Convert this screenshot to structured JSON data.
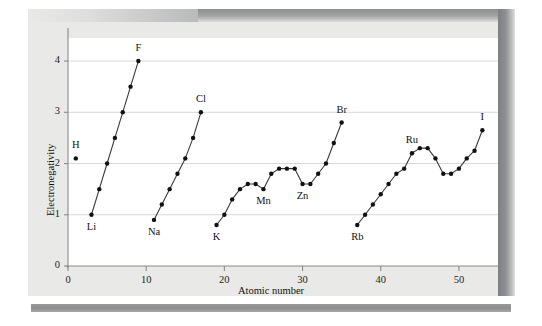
{
  "figure": {
    "background_color": "#e9e9e7",
    "plot_background_color": "#ffffff",
    "line_color": "#3a3a3a",
    "marker_color": "#111111",
    "grid_color": "#d8d8d8",
    "axis_color": "#8a8a8a"
  },
  "chart_data": {
    "type": "line",
    "title": "",
    "xlabel": "Atomic number",
    "ylabel": "Electronegativity",
    "xlim": [
      0,
      55
    ],
    "ylim": [
      0,
      4.45
    ],
    "xticks": [
      0,
      10,
      20,
      30,
      40,
      50
    ],
    "xtick_labels": [
      "0",
      "10",
      "20",
      "30",
      "40",
      "50"
    ],
    "yticks": [
      0,
      1,
      2,
      3,
      4
    ],
    "ytick_labels": [
      "0",
      "1",
      "2",
      "3",
      "4"
    ],
    "grid": "horizontal",
    "legend": "none",
    "series": [
      {
        "name": "hydrogen",
        "style": "marker-only",
        "points": [
          {
            "x": 1,
            "y": 2.1,
            "element": "H"
          }
        ]
      },
      {
        "name": "period-2",
        "style": "line-marker",
        "points": [
          {
            "x": 3,
            "y": 1.0,
            "element": "Li"
          },
          {
            "x": 4,
            "y": 1.5,
            "element": "Be"
          },
          {
            "x": 5,
            "y": 2.0,
            "element": "B"
          },
          {
            "x": 6,
            "y": 2.5,
            "element": "C"
          },
          {
            "x": 7,
            "y": 3.0,
            "element": "N"
          },
          {
            "x": 8,
            "y": 3.5,
            "element": "O"
          },
          {
            "x": 9,
            "y": 4.0,
            "element": "F"
          }
        ]
      },
      {
        "name": "period-3",
        "style": "line-marker",
        "points": [
          {
            "x": 11,
            "y": 0.9,
            "element": "Na"
          },
          {
            "x": 12,
            "y": 1.2,
            "element": "Mg"
          },
          {
            "x": 13,
            "y": 1.5,
            "element": "Al"
          },
          {
            "x": 14,
            "y": 1.8,
            "element": "Si"
          },
          {
            "x": 15,
            "y": 2.1,
            "element": "P"
          },
          {
            "x": 16,
            "y": 2.5,
            "element": "S"
          },
          {
            "x": 17,
            "y": 3.0,
            "element": "Cl"
          }
        ]
      },
      {
        "name": "period-4",
        "style": "line-marker",
        "points": [
          {
            "x": 19,
            "y": 0.8,
            "element": "K"
          },
          {
            "x": 20,
            "y": 1.0,
            "element": "Ca"
          },
          {
            "x": 21,
            "y": 1.3,
            "element": "Sc"
          },
          {
            "x": 22,
            "y": 1.5,
            "element": "Ti"
          },
          {
            "x": 23,
            "y": 1.6,
            "element": "V"
          },
          {
            "x": 24,
            "y": 1.6,
            "element": "Cr"
          },
          {
            "x": 25,
            "y": 1.5,
            "element": "Mn"
          },
          {
            "x": 26,
            "y": 1.8,
            "element": "Fe"
          },
          {
            "x": 27,
            "y": 1.9,
            "element": "Co"
          },
          {
            "x": 28,
            "y": 1.9,
            "element": "Ni"
          },
          {
            "x": 29,
            "y": 1.9,
            "element": "Cu"
          },
          {
            "x": 30,
            "y": 1.6,
            "element": "Zn"
          },
          {
            "x": 31,
            "y": 1.6,
            "element": "Ga"
          },
          {
            "x": 32,
            "y": 1.8,
            "element": "Ge"
          },
          {
            "x": 33,
            "y": 2.0,
            "element": "As"
          },
          {
            "x": 34,
            "y": 2.4,
            "element": "Se"
          },
          {
            "x": 35,
            "y": 2.8,
            "element": "Br"
          }
        ]
      },
      {
        "name": "period-5",
        "style": "line-marker",
        "points": [
          {
            "x": 37,
            "y": 0.8,
            "element": "Rb"
          },
          {
            "x": 38,
            "y": 1.0,
            "element": "Sr"
          },
          {
            "x": 39,
            "y": 1.2,
            "element": "Y"
          },
          {
            "x": 40,
            "y": 1.4,
            "element": "Zr"
          },
          {
            "x": 41,
            "y": 1.6,
            "element": "Nb"
          },
          {
            "x": 42,
            "y": 1.8,
            "element": "Mo"
          },
          {
            "x": 43,
            "y": 1.9,
            "element": "Tc"
          },
          {
            "x": 44,
            "y": 2.2,
            "element": "Ru"
          },
          {
            "x": 45,
            "y": 2.3,
            "element": "Rh"
          },
          {
            "x": 46,
            "y": 2.3,
            "element": "Pd"
          },
          {
            "x": 47,
            "y": 2.1,
            "element": "Ag"
          },
          {
            "x": 48,
            "y": 1.8,
            "element": "Cd"
          },
          {
            "x": 49,
            "y": 1.8,
            "element": "In"
          },
          {
            "x": 50,
            "y": 1.9,
            "element": "Sn"
          },
          {
            "x": 51,
            "y": 2.1,
            "element": "Sb"
          },
          {
            "x": 52,
            "y": 2.25,
            "element": "Te"
          },
          {
            "x": 53,
            "y": 2.65,
            "element": "I"
          }
        ]
      }
    ],
    "annotations": [
      {
        "text": "H",
        "x": 1,
        "y": 2.1,
        "position": "above"
      },
      {
        "text": "F",
        "x": 9,
        "y": 4.0,
        "position": "above"
      },
      {
        "text": "Li",
        "x": 3,
        "y": 1.0,
        "position": "below"
      },
      {
        "text": "Cl",
        "x": 17,
        "y": 3.0,
        "position": "above"
      },
      {
        "text": "Na",
        "x": 11,
        "y": 0.9,
        "position": "below"
      },
      {
        "text": "K",
        "x": 19,
        "y": 0.8,
        "position": "below"
      },
      {
        "text": "Mn",
        "x": 25,
        "y": 1.5,
        "position": "below"
      },
      {
        "text": "Zn",
        "x": 30,
        "y": 1.6,
        "position": "below"
      },
      {
        "text": "Br",
        "x": 35,
        "y": 2.8,
        "position": "above"
      },
      {
        "text": "Rb",
        "x": 37,
        "y": 0.8,
        "position": "below"
      },
      {
        "text": "Ru",
        "x": 44,
        "y": 2.2,
        "position": "above"
      },
      {
        "text": "I",
        "x": 53,
        "y": 2.65,
        "position": "above"
      }
    ]
  }
}
